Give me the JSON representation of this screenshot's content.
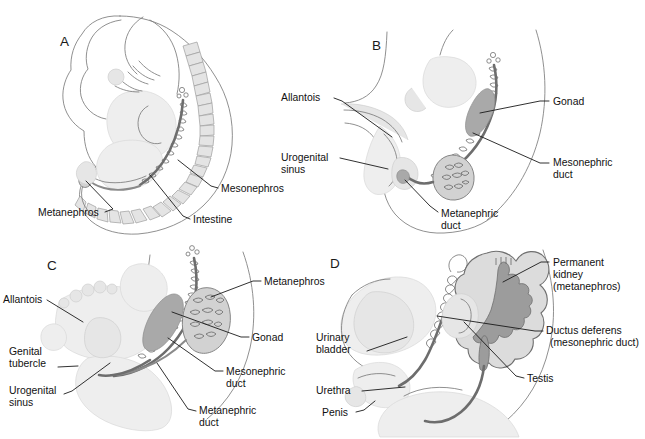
{
  "figure": {
    "width": 645,
    "height": 439,
    "background": "#ffffff",
    "label_color": "#111111",
    "leader_color": "#1a1a1a"
  },
  "panels": [
    {
      "id": "A",
      "letter": "A",
      "description": "Early embryo in lateral view showing mesonephros, metanephros and intestine",
      "labels": [
        {
          "key": "metanephros",
          "text": "Metanephros"
        },
        {
          "key": "intestine",
          "text": "Intestine"
        },
        {
          "key": "mesonephros",
          "text": "Mesonephros"
        }
      ]
    },
    {
      "id": "B",
      "letter": "B",
      "description": "Caudal region showing allantois, urogenital sinus, metanephric duct, mesonephric duct and gonad",
      "labels": [
        {
          "key": "allantois",
          "text": "Allantois"
        },
        {
          "key": "urogenital_sinus_line1",
          "text": "Urogenital"
        },
        {
          "key": "urogenital_sinus_line2",
          "text": "sinus"
        },
        {
          "key": "metanephric_duct_line1",
          "text": "Metanephric"
        },
        {
          "key": "metanephric_duct_line2",
          "text": "duct"
        },
        {
          "key": "gonad",
          "text": "Gonad"
        },
        {
          "key": "mesonephric_duct_line1",
          "text": "Mesonephric"
        },
        {
          "key": "mesonephric_duct_line2",
          "text": "duct"
        }
      ]
    },
    {
      "id": "C",
      "letter": "C",
      "description": "Later stage with genital tubercle, ascending metanephros and gonad",
      "labels": [
        {
          "key": "allantois",
          "text": "Allantois"
        },
        {
          "key": "genital_tubercle_line1",
          "text": "Genital"
        },
        {
          "key": "genital_tubercle_line2",
          "text": "tubercle"
        },
        {
          "key": "urogenital_sinus_line1",
          "text": "Urogenital"
        },
        {
          "key": "urogenital_sinus_line2",
          "text": "sinus"
        },
        {
          "key": "metanephros",
          "text": "Metanephros"
        },
        {
          "key": "gonad",
          "text": "Gonad"
        },
        {
          "key": "mesonephric_duct_line1",
          "text": "Mesonephric"
        },
        {
          "key": "mesonephric_duct_line2",
          "text": "duct"
        },
        {
          "key": "metanephric_duct_line1",
          "text": "Metanephric"
        },
        {
          "key": "metanephric_duct_line2",
          "text": "duct"
        }
      ]
    },
    {
      "id": "D",
      "letter": "D",
      "description": "Male fetus showing permanent kidney, ductus deferens, testis, urinary bladder, urethra and penis",
      "labels": [
        {
          "key": "urinary_bladder_line1",
          "text": "Urinary"
        },
        {
          "key": "urinary_bladder_line2",
          "text": "bladder"
        },
        {
          "key": "urethra",
          "text": "Urethra"
        },
        {
          "key": "penis",
          "text": "Penis"
        },
        {
          "key": "permanent_kidney_line1",
          "text": "Permanent"
        },
        {
          "key": "permanent_kidney_line2",
          "text": "kidney"
        },
        {
          "key": "permanent_kidney_line3",
          "text": "(metanephros)"
        },
        {
          "key": "ductus_deferens_line1",
          "text": "Ductus deferens"
        },
        {
          "key": "ductus_deferens_line2",
          "text": "(mesonephric duct)"
        },
        {
          "key": "testis",
          "text": "Testis"
        }
      ]
    }
  ]
}
